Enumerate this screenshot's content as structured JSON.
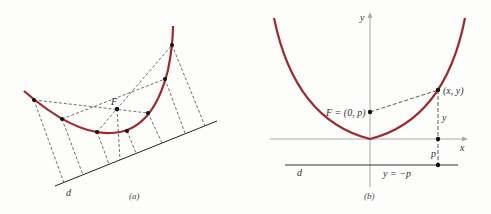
{
  "colors": {
    "curve": "#9e2a2b",
    "ink": "#222222",
    "axis": "#aaaaaa",
    "background": "#fdfdfb"
  },
  "panel_a": {
    "caption": "(a)",
    "focus_label": "F",
    "directrix_label": "d"
  },
  "panel_b": {
    "caption": "(b)",
    "y_axis_label": "y",
    "x_axis_label": "x",
    "focus_label": "F = (0, p)",
    "point_label": "(x, y)",
    "segment_y_label": "y",
    "segment_p_label": "p",
    "directrix_label": "d",
    "directrix_eq": "y = −p"
  }
}
